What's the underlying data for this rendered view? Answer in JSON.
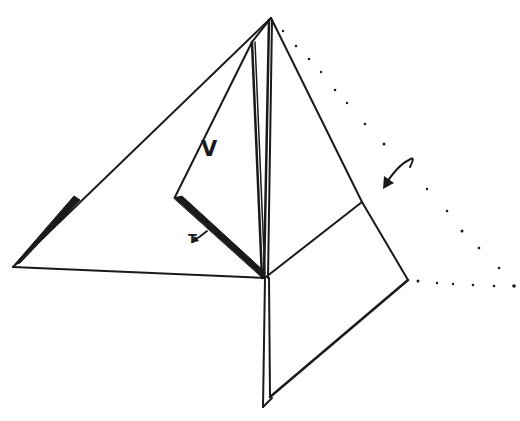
{
  "diagram": {
    "type": "origami-fold-step",
    "colors": {
      "line": "#1a1a1a",
      "background": "#ffffff"
    },
    "labels": {
      "v": "V",
      "t": "T"
    },
    "annotations": [
      {
        "name": "fold-arrow",
        "meaning": "fold flap over along dotted line"
      },
      {
        "name": "t-arrow",
        "meaning": "points to edge T"
      }
    ]
  }
}
